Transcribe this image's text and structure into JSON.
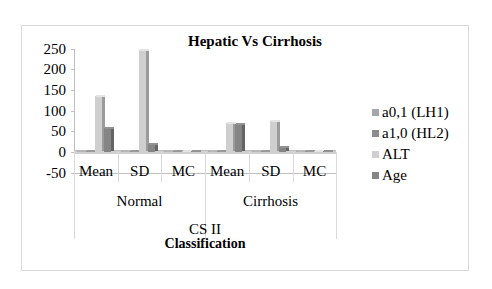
{
  "chart_data": {
    "type": "bar",
    "title": "Hepatic Vs Cirrhosis",
    "xlabel": "CS II",
    "xlabel_secondary": "Classification",
    "ylabel": "",
    "ylim": [
      -50,
      250
    ],
    "yticks": [
      250,
      200,
      150,
      100,
      50,
      0,
      -50
    ],
    "grid": false,
    "legend_position": "right",
    "groups": [
      {
        "name": "Normal",
        "categories": [
          "Mean",
          "SD",
          "MC"
        ]
      },
      {
        "name": "Cirrhosis",
        "categories": [
          "Mean",
          "SD",
          "MC"
        ]
      }
    ],
    "categories": [
      "Normal Mean",
      "Normal SD",
      "Normal MC",
      "Cirrhosis Mean",
      "Cirrhosis SD",
      "Cirrhosis MC"
    ],
    "series": [
      {
        "name": "a0,1 (LH1)",
        "color": "#a6a6a6",
        "values": [
          0.5,
          0.5,
          0.5,
          0.5,
          0.5,
          0.5
        ]
      },
      {
        "name": "a1,0 (HL2)",
        "color": "#8c8c8c",
        "values": [
          0.5,
          0.5,
          0.5,
          0.5,
          0.5,
          0.5
        ]
      },
      {
        "name": "ALT",
        "color": "#cfcfcf",
        "values": [
          137,
          248,
          1,
          73,
          78,
          1
        ]
      },
      {
        "name": "Age",
        "color": "#858585",
        "values": [
          60,
          22,
          1,
          70,
          15,
          1
        ]
      }
    ]
  },
  "labels": {
    "title": "Hepatic Vs Cirrhosis",
    "xtitle1": "CS II",
    "xtitle2": "Classification",
    "yticks": [
      "250",
      "200",
      "150",
      "100",
      "50",
      "0",
      "-50"
    ],
    "cats": [
      "Mean",
      "SD",
      "MC",
      "Mean",
      "SD",
      "MC"
    ],
    "groups": [
      "Normal",
      "Cirrhosis"
    ],
    "legend": [
      "a0,1 (LH1)",
      "a1,0 (HL2)",
      "ALT",
      "Age"
    ]
  }
}
